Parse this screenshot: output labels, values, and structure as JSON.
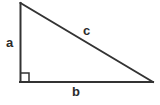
{
  "figure": {
    "type": "right-triangle-diagram",
    "background_color": "#ffffff",
    "stroke_color": "#333333",
    "label_color": "#2b2b2b",
    "stroke_width": 2,
    "canvas": {
      "width": 160,
      "height": 105
    }
  },
  "vertices": {
    "apex": {
      "name": "top-vertex",
      "x": 20,
      "y": 3
    },
    "right_angle": {
      "name": "bottom-left-vertex",
      "x": 20,
      "y": 82
    },
    "base_end": {
      "name": "bottom-right-vertex",
      "x": 153,
      "y": 82
    }
  },
  "right_angle_marker": {
    "present": true,
    "size": 9,
    "x": 20,
    "y": 73
  },
  "sides": [
    {
      "id": "leg-a",
      "label": "a",
      "role": "vertical-leg",
      "from": "apex",
      "to": "right_angle",
      "label_x": 6,
      "label_y": 36
    },
    {
      "id": "leg-b",
      "label": "b",
      "role": "horizontal-leg",
      "from": "right_angle",
      "to": "base_end",
      "label_x": 72,
      "label_y": 85
    },
    {
      "id": "hypotenuse-c",
      "label": "c",
      "role": "hypotenuse",
      "from": "apex",
      "to": "base_end",
      "label_x": 83,
      "label_y": 24
    }
  ]
}
